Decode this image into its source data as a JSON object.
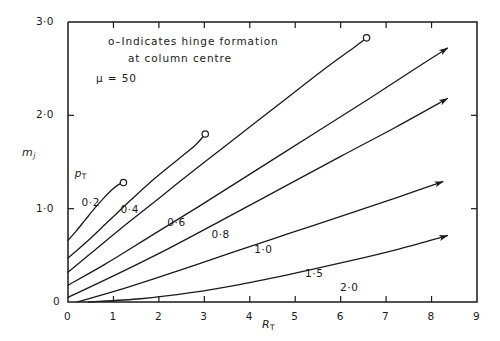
{
  "chart_data": {
    "type": "line",
    "title": "",
    "xlabel": "R_T",
    "ylabel": "m_j",
    "xlim": [
      0,
      9
    ],
    "ylim": [
      0,
      3.0
    ],
    "grid": false,
    "legend_position": "inline-curve-labels",
    "xticks": [
      "0",
      "1",
      "2",
      "3",
      "4",
      "5",
      "6",
      "7",
      "8",
      "9"
    ],
    "xtick_values": [
      0,
      1,
      2,
      3,
      4,
      5,
      6,
      7,
      8,
      9
    ],
    "yticks": [
      "0",
      "1·0",
      "2·0",
      "3·0"
    ],
    "ytick_values": [
      0,
      1.0,
      2.0,
      3.0
    ],
    "series_parameter_name": "p_T",
    "annotations": [
      "o–Indicates hinge formation",
      "at column centre",
      "μ = 50"
    ],
    "series": [
      {
        "name": "0·2",
        "label": "0·2",
        "end_marker": "circle",
        "points": [
          [
            0.0,
            0.66
          ],
          [
            0.18,
            0.76
          ],
          [
            0.38,
            0.88
          ],
          [
            0.58,
            1.0
          ],
          [
            0.78,
            1.11
          ],
          [
            0.96,
            1.2
          ],
          [
            1.12,
            1.26
          ],
          [
            1.22,
            1.28
          ]
        ]
      },
      {
        "name": "0·4",
        "label": "0·4",
        "end_marker": "circle",
        "points": [
          [
            0.0,
            0.47
          ],
          [
            0.4,
            0.64
          ],
          [
            0.9,
            0.87
          ],
          [
            1.4,
            1.1
          ],
          [
            1.9,
            1.32
          ],
          [
            2.4,
            1.52
          ],
          [
            2.8,
            1.68
          ],
          [
            3.02,
            1.8
          ]
        ]
      },
      {
        "name": "0·6",
        "label": "0·6",
        "end_marker": "circle",
        "points": [
          [
            0.0,
            0.32
          ],
          [
            0.6,
            0.56
          ],
          [
            1.3,
            0.84
          ],
          [
            2.1,
            1.15
          ],
          [
            2.9,
            1.46
          ],
          [
            3.8,
            1.8
          ],
          [
            4.7,
            2.14
          ],
          [
            5.6,
            2.48
          ],
          [
            6.3,
            2.73
          ],
          [
            6.57,
            2.83
          ]
        ]
      },
      {
        "name": "0·8",
        "label": "0·8",
        "end_marker": "arrow",
        "points": [
          [
            0.0,
            0.18
          ],
          [
            0.8,
            0.4
          ],
          [
            1.8,
            0.7
          ],
          [
            2.9,
            1.03
          ],
          [
            4.1,
            1.4
          ],
          [
            5.4,
            1.8
          ],
          [
            6.6,
            2.17
          ],
          [
            7.8,
            2.55
          ],
          [
            8.35,
            2.72
          ]
        ]
      },
      {
        "name": "1·0",
        "label": "1·0",
        "end_marker": "arrow",
        "points": [
          [
            0.0,
            0.05
          ],
          [
            1.0,
            0.28
          ],
          [
            2.2,
            0.57
          ],
          [
            3.4,
            0.88
          ],
          [
            4.7,
            1.22
          ],
          [
            6.0,
            1.56
          ],
          [
            7.2,
            1.87
          ],
          [
            8.35,
            2.18
          ]
        ]
      },
      {
        "name": "1·5",
        "label": "1·5",
        "end_marker": "arrow",
        "points": [
          [
            0.2,
            0.0
          ],
          [
            1.2,
            0.14
          ],
          [
            2.4,
            0.33
          ],
          [
            3.6,
            0.53
          ],
          [
            4.9,
            0.74
          ],
          [
            6.2,
            0.95
          ],
          [
            7.3,
            1.13
          ],
          [
            8.25,
            1.29
          ]
        ]
      },
      {
        "name": "2·0",
        "label": "2·0",
        "end_marker": "arrow",
        "points": [
          [
            0.45,
            0.0
          ],
          [
            1.6,
            0.035
          ],
          [
            2.7,
            0.1
          ],
          [
            3.8,
            0.19
          ],
          [
            5.0,
            0.31
          ],
          [
            6.2,
            0.44
          ],
          [
            7.3,
            0.57
          ],
          [
            8.35,
            0.71
          ]
        ]
      }
    ],
    "curve_label_positions": [
      {
        "label": "0·2",
        "x": 0.56,
        "y": 1.06
      },
      {
        "label": "0·4",
        "x": 1.42,
        "y": 0.99
      },
      {
        "label": "0·6",
        "x": 2.45,
        "y": 0.85
      },
      {
        "label": "0·8",
        "x": 3.42,
        "y": 0.72
      },
      {
        "label": "1·0",
        "x": 4.36,
        "y": 0.56
      },
      {
        "label": "1·5",
        "x": 5.48,
        "y": 0.3
      },
      {
        "label": "2·0",
        "x": 6.25,
        "y": 0.15
      }
    ],
    "pt_label_position": {
      "x": 0.28,
      "y": 1.37
    }
  }
}
